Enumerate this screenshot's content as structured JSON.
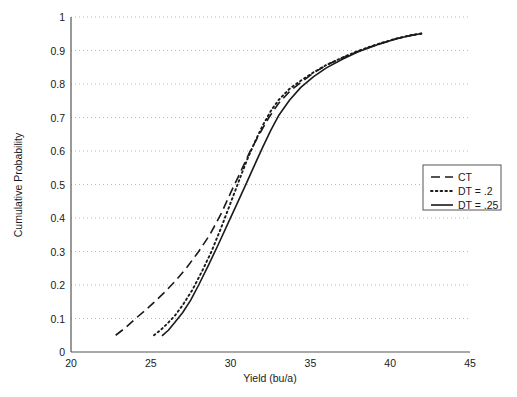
{
  "chart_data": {
    "type": "line",
    "title": "",
    "xlabel": "Yield (bu/a)",
    "ylabel": "Cumulative Probability",
    "xlim": [
      20,
      45
    ],
    "ylim": [
      0,
      1
    ],
    "xticks": [
      "20",
      "25",
      "30",
      "35",
      "40",
      "45"
    ],
    "yticks": [
      "0",
      "0.1",
      "0.2",
      "0.3",
      "0.4",
      "0.5",
      "0.6",
      "0.7",
      "0.8",
      "0.9",
      "1"
    ],
    "grid": "horizontal-dotted",
    "legend_position": "right-middle",
    "series": [
      {
        "name": "CT",
        "style": "dashed",
        "color": "#1a1a1a",
        "x": [
          22.8,
          23.4,
          24.0,
          24.6,
          25.2,
          25.9,
          26.6,
          27.3,
          28.0,
          28.7,
          29.4,
          30.0,
          30.6,
          31.2,
          31.8,
          32.4,
          33.0,
          33.7,
          34.4,
          35.2,
          36.0,
          37.0,
          38.0,
          39.2,
          40.4,
          41.3,
          42.0
        ],
        "y": [
          0.05,
          0.072,
          0.098,
          0.122,
          0.148,
          0.18,
          0.215,
          0.255,
          0.3,
          0.35,
          0.412,
          0.475,
          0.535,
          0.597,
          0.65,
          0.7,
          0.742,
          0.778,
          0.805,
          0.833,
          0.856,
          0.878,
          0.898,
          0.918,
          0.935,
          0.945,
          0.951
        ]
      },
      {
        "name": "DT = .2",
        "style": "dotted",
        "color": "#1a1a1a",
        "x": [
          25.2,
          25.6,
          26.0,
          26.5,
          27.0,
          27.6,
          28.2,
          28.8,
          29.4,
          30.0,
          30.5,
          31.0,
          31.5,
          32.0,
          32.5,
          33.0,
          33.7,
          34.4,
          35.2,
          36.0,
          37.0,
          38.0,
          39.2,
          40.4,
          41.3,
          42.0
        ],
        "y": [
          0.05,
          0.065,
          0.083,
          0.108,
          0.14,
          0.185,
          0.24,
          0.3,
          0.37,
          0.445,
          0.508,
          0.57,
          0.625,
          0.675,
          0.718,
          0.752,
          0.786,
          0.81,
          0.835,
          0.857,
          0.879,
          0.899,
          0.919,
          0.936,
          0.946,
          0.951
        ]
      },
      {
        "name": "DT = .25",
        "style": "solid",
        "color": "#1a1a1a",
        "x": [
          25.7,
          26.1,
          26.5,
          27.0,
          27.5,
          28.0,
          28.6,
          29.2,
          29.8,
          30.4,
          31.0,
          31.5,
          32.0,
          32.5,
          33.0,
          33.7,
          34.4,
          35.2,
          36.0,
          37.0,
          38.0,
          39.2,
          40.4,
          41.3,
          42.0
        ],
        "y": [
          0.048,
          0.065,
          0.088,
          0.118,
          0.155,
          0.2,
          0.258,
          0.318,
          0.38,
          0.442,
          0.505,
          0.558,
          0.61,
          0.66,
          0.705,
          0.752,
          0.79,
          0.822,
          0.848,
          0.874,
          0.896,
          0.917,
          0.935,
          0.945,
          0.951
        ]
      }
    ]
  }
}
